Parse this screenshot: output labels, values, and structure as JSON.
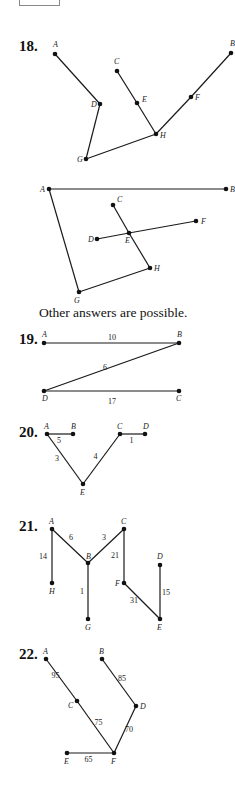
{
  "problems": [
    {
      "number": "18.",
      "graphs": [
        {
          "vertices": {
            "A": {
              "label": "A"
            },
            "B": {
              "label": "B"
            },
            "C": {
              "label": "C"
            },
            "D": {
              "label": "D"
            },
            "E": {
              "label": "E"
            },
            "F": {
              "label": "F"
            },
            "G": {
              "label": "G"
            },
            "H": {
              "label": "H"
            }
          },
          "edges": [
            [
              "A",
              "D"
            ],
            [
              "D",
              "G"
            ],
            [
              "G",
              "H"
            ],
            [
              "C",
              "E"
            ],
            [
              "E",
              "H"
            ],
            [
              "H",
              "F"
            ],
            [
              "F",
              "B"
            ]
          ]
        },
        {
          "vertices": {
            "A": {
              "label": "A"
            },
            "B": {
              "label": "B"
            },
            "C": {
              "label": "C"
            },
            "D": {
              "label": "D"
            },
            "E": {
              "label": "E"
            },
            "F": {
              "label": "F"
            },
            "G": {
              "label": "G"
            },
            "H": {
              "label": "H"
            }
          },
          "edges": [
            [
              "A",
              "B"
            ],
            [
              "A",
              "G"
            ],
            [
              "G",
              "H"
            ],
            [
              "C",
              "E"
            ],
            [
              "E",
              "H"
            ],
            [
              "D",
              "E"
            ],
            [
              "E",
              "F"
            ]
          ]
        }
      ],
      "note": "Other answers are possible."
    },
    {
      "number": "19.",
      "vertices": {
        "A": {
          "label": "A"
        },
        "B": {
          "label": "B"
        },
        "C": {
          "label": "C"
        },
        "D": {
          "label": "D"
        }
      },
      "edges": [
        {
          "from": "A",
          "to": "B",
          "weight": "10"
        },
        {
          "from": "B",
          "to": "D",
          "weight": "6"
        },
        {
          "from": "D",
          "to": "C",
          "weight": "17"
        }
      ]
    },
    {
      "number": "20.",
      "vertices": {
        "A": {
          "label": "A"
        },
        "B": {
          "label": "B"
        },
        "C": {
          "label": "C"
        },
        "D": {
          "label": "D"
        },
        "E": {
          "label": "E"
        }
      },
      "edges": [
        {
          "from": "A",
          "to": "B",
          "weight": "5"
        },
        {
          "from": "A",
          "to": "E",
          "weight": "3"
        },
        {
          "from": "E",
          "to": "C",
          "weight": "4"
        },
        {
          "from": "C",
          "to": "D",
          "weight": "1"
        }
      ]
    },
    {
      "number": "21.",
      "vertices": {
        "A": {
          "label": "A"
        },
        "B": {
          "label": "B"
        },
        "C": {
          "label": "C"
        },
        "D": {
          "label": "D"
        },
        "E": {
          "label": "E"
        },
        "F": {
          "label": "F"
        },
        "G": {
          "label": "G"
        },
        "H": {
          "label": "H"
        }
      },
      "edges": [
        {
          "from": "A",
          "to": "H",
          "weight": "14"
        },
        {
          "from": "A",
          "to": "B",
          "weight": "6"
        },
        {
          "from": "B",
          "to": "C",
          "weight": "3"
        },
        {
          "from": "B",
          "to": "G",
          "weight": "1"
        },
        {
          "from": "C",
          "to": "F",
          "weight": "21"
        },
        {
          "from": "F",
          "to": "E",
          "weight": "31"
        },
        {
          "from": "E",
          "to": "D",
          "weight": "15"
        }
      ]
    },
    {
      "number": "22.",
      "vertices": {
        "A": {
          "label": "A"
        },
        "B": {
          "label": "B"
        },
        "C": {
          "label": "C"
        },
        "D": {
          "label": "D"
        },
        "E": {
          "label": "E"
        },
        "F": {
          "label": "F"
        }
      },
      "edges": [
        {
          "from": "A",
          "to": "C",
          "weight": "95"
        },
        {
          "from": "C",
          "to": "F",
          "weight": "75"
        },
        {
          "from": "B",
          "to": "D",
          "weight": "85"
        },
        {
          "from": "D",
          "to": "F",
          "weight": "70"
        },
        {
          "from": "E",
          "to": "F",
          "weight": "65"
        }
      ]
    }
  ]
}
